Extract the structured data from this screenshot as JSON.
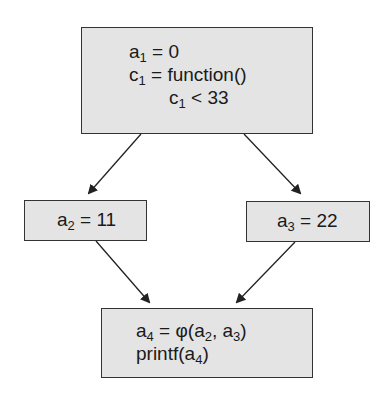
{
  "diagram": {
    "type": "control-flow-graph (SSA form)",
    "nodes": [
      {
        "id": "entry",
        "lines": [
          {
            "var": "a",
            "sub": "1",
            "rest": " = 0"
          },
          {
            "var": "c",
            "sub": "1",
            "rest": " = function()"
          },
          {
            "var": "c",
            "sub": "1",
            "rest": " < 33"
          }
        ]
      },
      {
        "id": "left",
        "lines": [
          {
            "var": "a",
            "sub": "2",
            "rest": " = 11"
          }
        ]
      },
      {
        "id": "right",
        "lines": [
          {
            "var": "a",
            "sub": "3",
            "rest": " = 22"
          }
        ]
      },
      {
        "id": "join",
        "line1": {
          "var": "a",
          "sub": "4",
          "eq": " = φ(",
          "arg1": "a",
          "arg1sub": "2",
          "sep": ", ",
          "arg2": "a",
          "arg2sub": "3",
          "close": ")"
        },
        "line2": {
          "pre": "printf(",
          "var": "a",
          "sub": "4",
          "close": ")"
        }
      }
    ],
    "edges": [
      {
        "from": "entry",
        "to": "left"
      },
      {
        "from": "entry",
        "to": "right"
      },
      {
        "from": "left",
        "to": "join"
      },
      {
        "from": "right",
        "to": "join"
      }
    ],
    "colors": {
      "box_fill": "#e4e4e4",
      "border": "#333333",
      "arrow": "#222222"
    }
  }
}
